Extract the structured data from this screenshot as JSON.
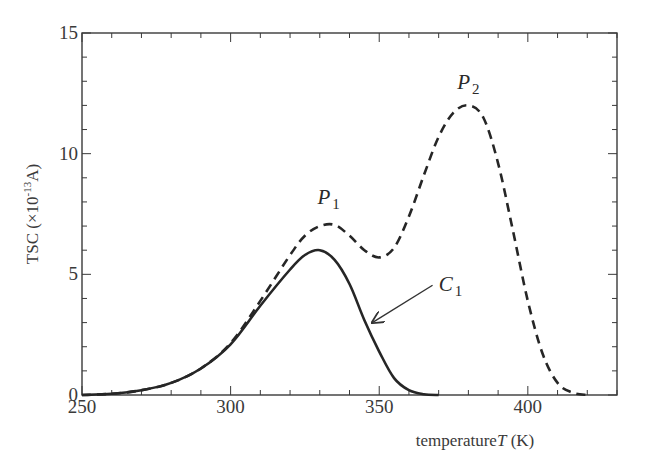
{
  "chart_data": {
    "type": "line",
    "title": "",
    "xlabel": "temperature T (K)",
    "xlabel_parts": {
      "text": "temperature",
      "var": "T",
      "unit": " (K)"
    },
    "ylabel": "TSC (×10^-13 A)",
    "ylabel_parts": {
      "prefix": "TSC (×10",
      "exp": "-13",
      "suffix": "A)"
    },
    "xlim": [
      250,
      430
    ],
    "ylim": [
      0,
      15
    ],
    "xticks": [
      250,
      300,
      350,
      400
    ],
    "yticks": [
      0,
      5,
      10,
      15
    ],
    "x_minor_step": 10,
    "y_minor_step": 1,
    "grid": false,
    "legend": null,
    "series": [
      {
        "name": "C1",
        "style": "solid",
        "x": [
          250,
          260,
          270,
          280,
          290,
          300,
          310,
          320,
          325,
          330,
          335,
          340,
          345,
          350,
          355,
          360,
          365,
          370
        ],
        "y": [
          0.0,
          0.05,
          0.2,
          0.5,
          1.1,
          2.1,
          3.7,
          5.2,
          5.8,
          6.0,
          5.6,
          4.6,
          3.1,
          1.8,
          0.7,
          0.2,
          0.03,
          0.0
        ]
      },
      {
        "name": "Total (P1 + P2)",
        "style": "dashed",
        "x": [
          250,
          260,
          270,
          280,
          290,
          300,
          310,
          320,
          325,
          330,
          335,
          340,
          345,
          350,
          355,
          360,
          365,
          370,
          375,
          380,
          385,
          390,
          395,
          400,
          405,
          410,
          415,
          420
        ],
        "y": [
          0.0,
          0.05,
          0.2,
          0.5,
          1.1,
          2.15,
          3.9,
          5.8,
          6.6,
          7.0,
          7.05,
          6.6,
          6.0,
          5.7,
          6.1,
          7.4,
          9.1,
          10.7,
          11.7,
          12.0,
          11.5,
          9.6,
          6.8,
          3.9,
          1.7,
          0.5,
          0.1,
          0.0
        ]
      }
    ],
    "annotations": [
      {
        "label": "P",
        "sub": "1",
        "x": 333,
        "y": 7.9
      },
      {
        "label": "P",
        "sub": "2",
        "x": 380,
        "y": 12.7
      },
      {
        "label": "C",
        "sub": "1",
        "x": 374,
        "y": 4.3,
        "arrow_to": {
          "x": 347,
          "y": 3.0
        }
      }
    ]
  }
}
